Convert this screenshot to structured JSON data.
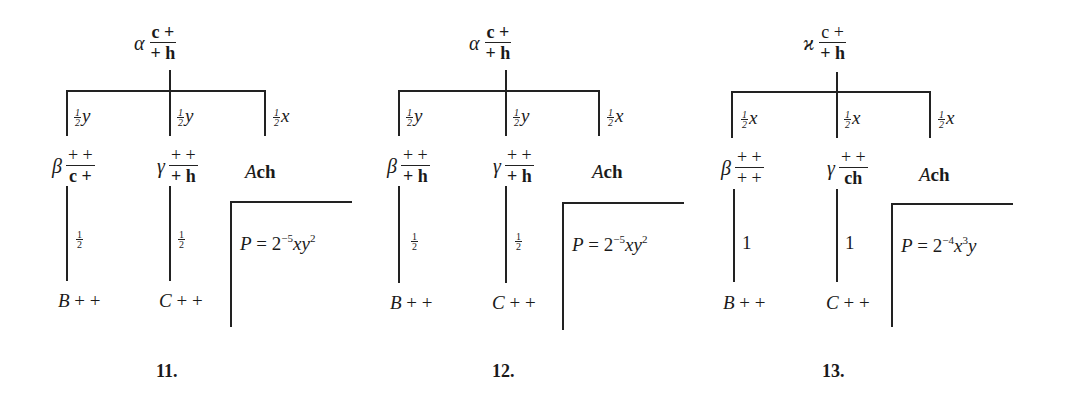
{
  "diagrams": [
    {
      "number": "11.",
      "root": {
        "greek": "α",
        "num": "c +",
        "den": "+ h"
      },
      "branch_labels": [
        {
          "coef_num": "1",
          "coef_den": "2",
          "var": "y"
        },
        {
          "coef_num": "1",
          "coef_den": "2",
          "var": "y"
        },
        {
          "coef_num": "1",
          "coef_den": "2",
          "var": "x"
        }
      ],
      "children": [
        {
          "greek": "β",
          "num": "+ +",
          "den": "c +"
        },
        {
          "greek": "γ",
          "num": "+ +",
          "den": "+ h"
        },
        {
          "label_italic": "A",
          "label_bold": "ch"
        }
      ],
      "sub_labels": [
        {
          "type": "half",
          "num": "1",
          "den": "2"
        },
        {
          "type": "half",
          "num": "1",
          "den": "2"
        }
      ],
      "leaves": [
        {
          "italic": "B",
          "rest": "+ +"
        },
        {
          "italic": "C",
          "rest": "+ +"
        }
      ],
      "probability": {
        "lhs": "P",
        "eq": " = 2",
        "exp": "−5",
        "vars": "xy",
        "vars_exp": "2",
        "tail": ""
      }
    },
    {
      "number": "12.",
      "root": {
        "greek": "α",
        "num": "c +",
        "den": "+ h"
      },
      "branch_labels": [
        {
          "coef_num": "1",
          "coef_den": "2",
          "var": "y"
        },
        {
          "coef_num": "1",
          "coef_den": "2",
          "var": "y"
        },
        {
          "coef_num": "1",
          "coef_den": "2",
          "var": "x"
        }
      ],
      "children": [
        {
          "greek": "β",
          "num": "+ +",
          "den": "+ h"
        },
        {
          "greek": "γ",
          "num": "+ +",
          "den": "+ h"
        },
        {
          "label_italic": "A",
          "label_bold": "ch"
        }
      ],
      "sub_labels": [
        {
          "type": "half",
          "num": "1",
          "den": "2"
        },
        {
          "type": "half",
          "num": "1",
          "den": "2"
        }
      ],
      "leaves": [
        {
          "italic": "B",
          "rest": "+ +"
        },
        {
          "italic": "C",
          "rest": "+ +"
        }
      ],
      "probability": {
        "lhs": "P",
        "eq": " = 2",
        "exp": "−5",
        "vars": "xy",
        "vars_exp": "2",
        "tail": ""
      }
    },
    {
      "number": "13.",
      "root": {
        "greek": "ϰ",
        "num": "c +",
        "den": "+ h"
      },
      "branch_labels": [
        {
          "coef_num": "1",
          "coef_den": "2",
          "var": "x"
        },
        {
          "coef_num": "1",
          "coef_den": "2",
          "var": "x"
        },
        {
          "coef_num": "1",
          "coef_den": "2",
          "var": "x"
        }
      ],
      "children": [
        {
          "greek": "β",
          "num": "+ +",
          "den": "+ +"
        },
        {
          "greek": "γ",
          "num": "+ +",
          "den": "ch"
        },
        {
          "label_italic": "A",
          "label_bold": "ch"
        }
      ],
      "sub_labels": [
        {
          "type": "whole",
          "value": "1"
        },
        {
          "type": "whole",
          "value": "1"
        }
      ],
      "leaves": [
        {
          "italic": "B",
          "rest": "+ +"
        },
        {
          "italic": "C",
          "rest": "+ +"
        }
      ],
      "probability": {
        "lhs": "P",
        "eq": " = 2",
        "exp": "−4",
        "vars": "x",
        "vars_exp": "3",
        "tail": "y"
      }
    }
  ]
}
